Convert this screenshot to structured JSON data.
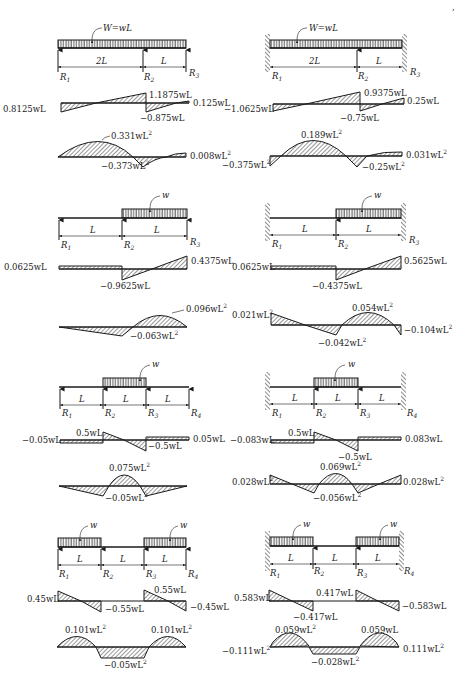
{
  "page": {
    "corner_mark": ","
  },
  "panels": [
    {
      "id": "two-span-continuous",
      "column": "left",
      "ends": "simply-supported",
      "load_label": "W = wL",
      "spans": [
        "2L",
        "L"
      ],
      "reactions": [
        "R1",
        "R2",
        "R3"
      ],
      "shear": {
        "labels": [
          "0.8125wL",
          "1.1875wL",
          "-0.875wL",
          "0.125wL"
        ]
      },
      "moment": {
        "labels": [
          "0.331wL²",
          "-0.373wL²",
          "0.008wL²"
        ]
      }
    },
    {
      "id": "two-span-fixed",
      "column": "right",
      "ends": "fixed",
      "load_label": "W = wL",
      "spans": [
        "2L",
        "L"
      ],
      "reactions": [
        "R1",
        "R2",
        "R3"
      ],
      "shear": {
        "labels": [
          "-1.0625wL",
          "0.9375wL",
          "-0.75wL",
          "0.25wL"
        ]
      },
      "moment": {
        "labels": [
          "-0.375wL²",
          "0.189wL²",
          "-0.25wL²",
          "0.031wL²"
        ]
      }
    },
    {
      "id": "two-span-partial-load",
      "column": "left",
      "ends": "simply-supported",
      "load_label": "w",
      "spans": [
        "L",
        "L"
      ],
      "reactions": [
        "R1",
        "R2",
        "R3"
      ],
      "shear": {
        "labels": [
          "0.0625wL",
          "-0.9625wL",
          "0.4375wL"
        ]
      },
      "moment": {
        "labels": [
          "0.096wL²",
          "-0.063wL²"
        ]
      }
    },
    {
      "id": "two-span-partial-load-fixed",
      "column": "right",
      "ends": "fixed",
      "load_label": "w",
      "spans": [
        "L",
        "L"
      ],
      "reactions": [
        "R1",
        "R2",
        "R3"
      ],
      "shear": {
        "labels": [
          "0.0625wL",
          "-0.4375wL",
          "0.5625wL"
        ]
      },
      "moment": {
        "labels": [
          "0.021wL²",
          "0.054wL²",
          "-0.042wL²",
          "-0.104wL²"
        ]
      }
    },
    {
      "id": "three-span-center-load",
      "column": "left",
      "ends": "simply-supported",
      "load_label": "w",
      "spans": [
        "L",
        "L",
        "L"
      ],
      "reactions": [
        "R1",
        "R2",
        "R3",
        "R4"
      ],
      "shear": {
        "labels": [
          "-0.05wL",
          "0.5wL",
          "-0.5wL",
          "0.05wL"
        ]
      },
      "moment": {
        "labels": [
          "0.075wL²",
          "-0.05wL²"
        ]
      }
    },
    {
      "id": "three-span-center-load-fixed",
      "column": "right",
      "ends": "fixed",
      "load_label": "w",
      "spans": [
        "L",
        "L",
        "L"
      ],
      "reactions": [
        "R1",
        "R2",
        "R3",
        "R4"
      ],
      "shear": {
        "labels": [
          "-0.083wL",
          "0.5wL",
          "-0.5wL",
          "0.083wL"
        ]
      },
      "moment": {
        "labels": [
          "0.028wL²",
          "0.069wL²",
          "-0.056wL²",
          "0.028wL²"
        ]
      }
    },
    {
      "id": "three-span-end-loads",
      "column": "left",
      "ends": "simply-supported",
      "load_label": "w",
      "spans": [
        "L",
        "L",
        "L"
      ],
      "reactions": [
        "R1",
        "R2",
        "R3",
        "R4"
      ],
      "shear": {
        "labels": [
          "0.45wL",
          "-0.55wL",
          "0.55wL",
          "-0.45wL"
        ]
      },
      "moment": {
        "labels": [
          "0.101wL²",
          "0.101wL²",
          "-0.05wL²"
        ]
      }
    },
    {
      "id": "three-span-end-loads-fixed",
      "column": "right",
      "ends": "fixed",
      "load_label": "w",
      "spans": [
        "L",
        "L",
        "L"
      ],
      "reactions": [
        "R1",
        "R2",
        "R3",
        "R4"
      ],
      "shear": {
        "labels": [
          "0.583wL",
          "0.417wL",
          "-0.417wL",
          "-0.583wL"
        ]
      },
      "moment": {
        "labels": [
          "-0.111wL²",
          "0.059wL²",
          "0.059wL",
          "-0.028wL²",
          "0.111wL²"
        ]
      }
    }
  ],
  "labels": {
    "p1": {
      "load": "W=wL",
      "s1": "2L",
      "s2": "L",
      "r1": "R",
      "r2": "R",
      "r3": "R",
      "sub1": "1",
      "sub2": "2",
      "sub3": "3",
      "v1": "0.8125wL",
      "v2": "1.1875wL",
      "v3": "−0.875wL",
      "v4": "0.125wL",
      "m1": "0.331wL",
      "m2": "−0.373wL",
      "m3": "0.008wL",
      "sq": "2"
    },
    "p2": {
      "load": "W=wL",
      "s1": "2L",
      "s2": "L",
      "v1": "−1.0625wL",
      "v2": "0.9375wL",
      "v3": "−0.75wL",
      "v4": "0.25wL",
      "m1": "−0.375wL",
      "m2": "0.189wL",
      "m3": "−0.25wL",
      "m4": "0.031wL"
    },
    "p3": {
      "load": "w",
      "s1": "L",
      "s2": "L",
      "v1": "0.0625wL",
      "v2": "−0.9625wL",
      "v3": "0.4375wL",
      "m1": "0.096wL",
      "m2": "−0.063wL"
    },
    "p4": {
      "load": "w",
      "s1": "L",
      "s2": "L",
      "v1": "0.0625wL",
      "v2": "−0.4375wL",
      "v3": "0.5625wL",
      "m1": "0.021wL",
      "m2": "0.054wL",
      "m3": "−0.042wL",
      "m4": "−0.104wL"
    },
    "p5": {
      "load": "w",
      "s1": "L",
      "s2": "L",
      "s3": "L",
      "v1": "−0.05wL",
      "v2": "0.5wL",
      "v3": "−0.5wL",
      "v4": "0.05wL",
      "m1": "0.075wL",
      "m2": "−0.05wL"
    },
    "p6": {
      "load": "w",
      "s1": "L",
      "s2": "L",
      "s3": "L",
      "v1": "−0.083wL",
      "v2": "0.5wL",
      "v3": "−0.5wL",
      "v4": "0.083wL",
      "m1": "0.028wL",
      "m2": "0.069wL",
      "m3": "−0.056wL",
      "m4": "0.028wL"
    },
    "p7": {
      "load": "w",
      "s1": "L",
      "s2": "L",
      "s3": "L",
      "v1": "0.45wL",
      "v2": "−0.55wL",
      "v3": "0.55wL",
      "v4": "−0.45wL",
      "m1": "0.101wL",
      "m2": "0.101wL",
      "m3": "−0.05wL"
    },
    "p8": {
      "load": "w",
      "s1": "L",
      "s2": "L",
      "s3": "L",
      "v1": "0.583wL",
      "v2": "0.417wL",
      "v3": "−0.417wL",
      "v4": "−0.583wL",
      "m1": "0.059wL",
      "m2": "0.059wL",
      "m3": "−0.111wL",
      "m4": "−0.028wL",
      "m5": "0.111wL"
    },
    "r": {
      "R": "R",
      "s1": "1",
      "s2": "2",
      "s3": "3",
      "s4": "4"
    },
    "sup": "2"
  }
}
